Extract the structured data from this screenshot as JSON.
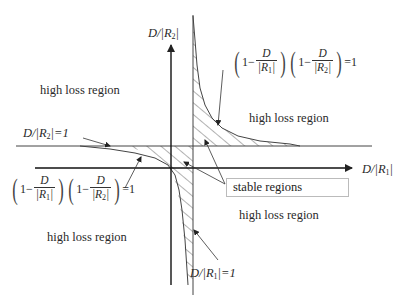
{
  "diagram": {
    "axes": {
      "x_label": "D/|R1|",
      "y_label": "D/|R2|"
    },
    "lines": {
      "r1_line_label": "D/|R1| = 1",
      "r2_line_label": "D/|R2| = 1"
    },
    "equations": {
      "upper_right": {
        "lhs_factor1_num": "D",
        "lhs_factor1_den": "R1",
        "lhs_factor2_num": "D",
        "lhs_factor2_den": "R2",
        "rhs": "=1",
        "one": "1"
      },
      "lower_left": {
        "lhs_factor1_num": "D",
        "lhs_factor1_den": "R1",
        "lhs_factor2_num": "D",
        "lhs_factor2_den": "R2",
        "rhs": "=1",
        "one": "1"
      }
    },
    "regions": {
      "top_left": "high loss region",
      "top_right": "high loss region",
      "bottom_left": "high loss region",
      "bottom_right": "high loss region",
      "stable": "stable regions"
    },
    "colors": {
      "line": "#333333",
      "hatch": "#555555",
      "background": "#ffffff"
    }
  }
}
